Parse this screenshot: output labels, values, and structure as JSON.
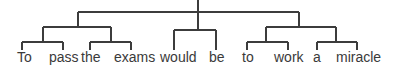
{
  "diagram": {
    "type": "constituency-tree",
    "line_color": "#3c3c3c",
    "text_color": "#3a3a3a",
    "words": [
      {
        "text": "To",
        "x": 20
      },
      {
        "text": "pass",
        "x": 49
      },
      {
        "text": "the",
        "x": 82
      },
      {
        "text": "exams",
        "x": 114
      },
      {
        "text": "would",
        "x": 161
      },
      {
        "text": "be",
        "x": 209
      },
      {
        "text": "to",
        "x": 242
      },
      {
        "text": "work",
        "x": 274
      },
      {
        "text": "a",
        "x": 315
      },
      {
        "text": "miracle",
        "x": 336
      }
    ],
    "structure": "[[[To pass] [the exams]] [would be] [[to work] [a miracle]]]"
  }
}
